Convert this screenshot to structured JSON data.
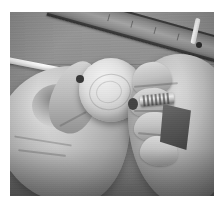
{
  "image": {
    "kind": "photograph",
    "subject": "two-hands-assembling-wooden-ball-and-screw",
    "palette": "grayscale",
    "caption": "",
    "frame": {
      "canvas_width_px": 224,
      "canvas_height_px": 208,
      "photo_left_px": 10,
      "photo_top_px": 12,
      "photo_width_px": 204,
      "photo_height_px": 184,
      "border_color": "#ffffff"
    },
    "colors": {
      "background_bench": "#8e8e8b",
      "bench_dark": "#7d7d77",
      "wood_ball_light": "#f4efe4",
      "wood_ball_mid": "#cfc5b2",
      "wood_ball_shadow": "#7e7364",
      "skin_light": "#e3ddd2",
      "skin_mid": "#b0a89a",
      "skin_shadow": "#6d6559",
      "ruler_wood": "#a4a49c",
      "ruler_edge_dark": "#1e1e1a",
      "metal_screw": "#efeade",
      "dark_block": "#46443e",
      "white_rod": "#ffffff",
      "pencil_tip": "#2e2e2a"
    },
    "objects": [
      {
        "name": "workbench-surface",
        "description": "flat gray wooden workbench with faint horizontal seams"
      },
      {
        "name": "wooden-ruler",
        "description": "long wooden batten running diagonally across the upper area"
      },
      {
        "name": "white-pencil",
        "description": "small white pencil or dowel at top right with dark tip"
      },
      {
        "name": "white-rod",
        "description": "slender white rod entering from the left edge"
      },
      {
        "name": "wooden-ball",
        "description": "light wooden sphere with visible grain ring, drilled hole on the right"
      },
      {
        "name": "threaded-screw",
        "description": "short threaded dowel screw held between right-hand fingers"
      },
      {
        "name": "dark-block",
        "description": "dark angular block or sandpaper piece resting in the right palm"
      },
      {
        "name": "left-hand",
        "description": "left hand gripping the wooden ball from below-left"
      },
      {
        "name": "right-hand",
        "description": "right hand with four fingers guiding the screw into the ball"
      }
    ]
  }
}
